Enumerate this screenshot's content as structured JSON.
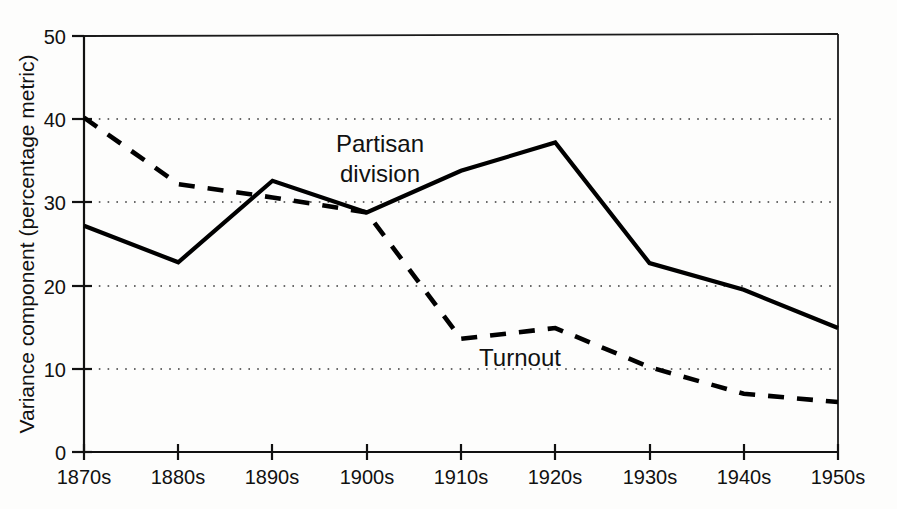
{
  "chart_data": {
    "type": "line",
    "title": "",
    "xlabel": "",
    "ylabel": "Variance component (percentage metric)",
    "categories": [
      "1870s",
      "1880s",
      "1890s",
      "1900s",
      "1910s",
      "1920s",
      "1930s",
      "1940s",
      "1950s"
    ],
    "ylim": [
      0,
      50
    ],
    "yticks": [
      0,
      10,
      20,
      30,
      40,
      50
    ],
    "ytick_labels": [
      "0",
      "10",
      "20",
      "30",
      "40",
      "50"
    ],
    "grid": "horizontal dotted gridlines at 10, 20, 30, 40",
    "legend_position": "inline annotations on plot",
    "series": [
      {
        "name": "Partisan division",
        "style": "solid",
        "color": "#000000",
        "values": [
          27.2,
          22.8,
          32.6,
          28.8,
          33.8,
          37.2,
          22.7,
          19.5,
          14.9
        ]
      },
      {
        "name": "Turnout",
        "style": "dashed",
        "color": "#000000",
        "values": [
          40.2,
          32.2,
          30.6,
          28.8,
          13.6,
          14.9,
          10.2,
          7.0,
          6.0
        ]
      }
    ],
    "annotations": [
      {
        "text": "Partisan division",
        "lines": [
          "Partisan",
          "division"
        ],
        "x_value": "1890s-1900s",
        "y_value": 36.5
      },
      {
        "text": "Turnout",
        "lines": [
          "Turnout"
        ],
        "x_value": "1910s-1920s",
        "y_value": 11.8
      }
    ]
  },
  "axes": {
    "y_title": "Variance component (percentage metric)",
    "y_ticks": [
      "0",
      "10",
      "20",
      "30",
      "40",
      "50"
    ],
    "x_ticks": [
      "1870s",
      "1880s",
      "1890s",
      "1900s",
      "1910s",
      "1920s",
      "1930s",
      "1940s",
      "1950s"
    ]
  },
  "labels": {
    "partisan_line1": "Partisan",
    "partisan_line2": "division",
    "turnout": "Turnout"
  },
  "colors": {
    "ink": "#000000",
    "grid": "#3a3a3a",
    "background": "#fdfdfc"
  }
}
